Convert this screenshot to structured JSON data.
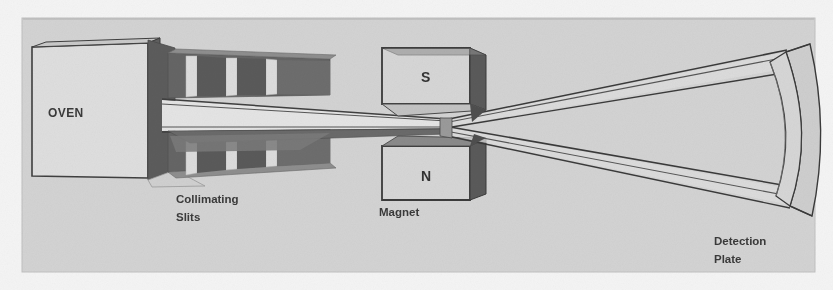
{
  "figure": {
    "background_color": "#f2f2f2",
    "panel_color": "#d2d2d2",
    "ink_color": "#3a3a3a",
    "shade_dark": "#6b6b6b",
    "shade_mid": "#7d7d7d",
    "face_light": "#dcdcdc"
  },
  "labels": {
    "oven": "OVEN",
    "collimating_slits_line1": "Collimating",
    "collimating_slits_line2": "Slits",
    "magnet": "Magnet",
    "pole_top": "S",
    "pole_bottom": "N",
    "detection_plate_line1": "Detection",
    "detection_plate_line2": "Plate"
  },
  "components": {
    "oven": {
      "kind": "box-3d",
      "face": "light",
      "right_face": "dark"
    },
    "collimating_slits": {
      "kind": "slit-stack",
      "bands": 2,
      "slits_per_band": 3
    },
    "magnet": {
      "kind": "pole-pair",
      "top_pole": "S",
      "bottom_pole": "N"
    },
    "beam": {
      "kind": "split-beam",
      "branches": 2,
      "direction": "left-to-right"
    },
    "detection_plate": {
      "kind": "curved-screen",
      "curvature": "concave-left"
    }
  }
}
